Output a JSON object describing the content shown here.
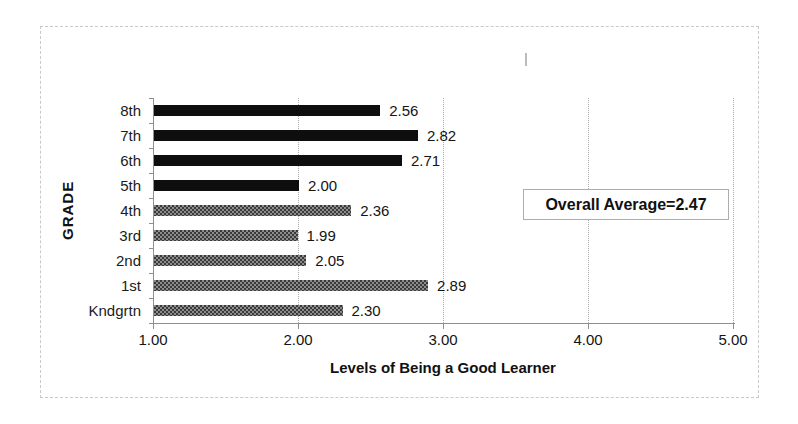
{
  "chart_data": {
    "type": "bar",
    "orientation": "horizontal",
    "title": "",
    "xlabel": "Levels of Being a Good Learner",
    "ylabel": "GRADE",
    "categories": [
      "8th",
      "7th",
      "6th",
      "5th",
      "4th",
      "3rd",
      "2nd",
      "1st",
      "Kndgrtn"
    ],
    "values": [
      2.56,
      2.82,
      2.71,
      2.0,
      2.36,
      1.99,
      2.05,
      2.89,
      2.3
    ],
    "value_labels": [
      "2.56",
      "2.82",
      "2.71",
      "2.00",
      "2.36",
      "1.99",
      "2.05",
      "2.89",
      "2.30"
    ],
    "bar_styles": [
      "solid",
      "solid",
      "solid",
      "solid",
      "pattern",
      "pattern",
      "pattern",
      "pattern",
      "pattern"
    ],
    "xlim": [
      1.0,
      5.0
    ],
    "x_ticks": [
      1.0,
      2.0,
      3.0,
      4.0,
      5.0
    ],
    "x_tick_labels": [
      "1.00",
      "2.00",
      "3.00",
      "4.00",
      "5.00"
    ],
    "grid": "vertical dotted gridlines at each x tick",
    "legend": null,
    "annotation": {
      "text": "Overall Average=2.47"
    },
    "colors": {
      "solid_bar": "#0e0e0e",
      "pattern_bar_dark": "#3a3a3a",
      "pattern_bar_light": "#8c8c8c",
      "gridline": "#ababab",
      "axis": "#8f8f8f",
      "frame_border": "#c9c9c9",
      "text": "#1b1b1b",
      "background": "#ffffff"
    }
  }
}
